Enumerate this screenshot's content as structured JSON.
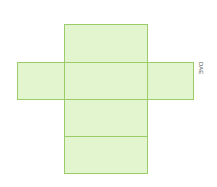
{
  "diagram": {
    "type": "cuboid-net",
    "colors": {
      "fill": "#e3f5cf",
      "stroke": "#9ccc6a"
    },
    "faces": [
      {
        "id": "top",
        "x": 64,
        "y": 24,
        "w": 83,
        "h": 38
      },
      {
        "id": "left",
        "x": 17,
        "y": 62,
        "w": 47,
        "h": 37
      },
      {
        "id": "center",
        "x": 64,
        "y": 62,
        "w": 83,
        "h": 37
      },
      {
        "id": "right",
        "x": 147,
        "y": 62,
        "w": 46,
        "h": 37
      },
      {
        "id": "lower1",
        "x": 64,
        "y": 99,
        "w": 83,
        "h": 37
      },
      {
        "id": "lower2",
        "x": 64,
        "y": 136,
        "w": 83,
        "h": 37
      }
    ],
    "label": {
      "text": "DAE",
      "x": 204,
      "y": 62
    }
  }
}
